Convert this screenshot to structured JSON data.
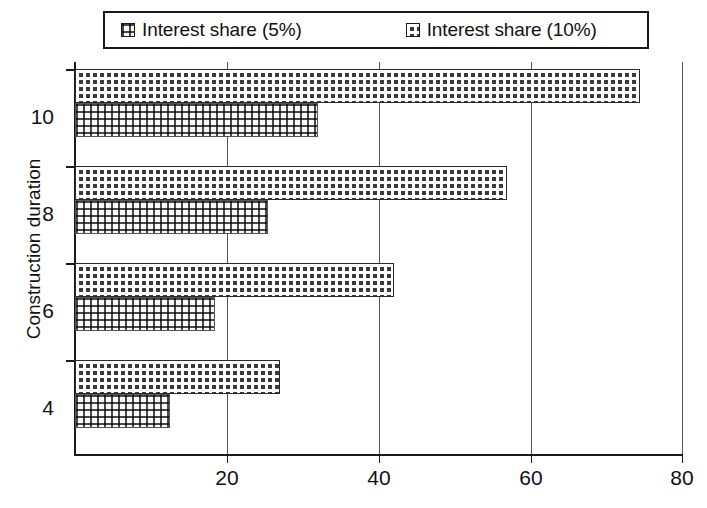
{
  "legend": {
    "entries": [
      {
        "label": "Interest share (5%)",
        "swatch": "light-dotted-swatch-icon"
      },
      {
        "label": "Interest share (10%)",
        "swatch": "dark-dotted-swatch-icon"
      }
    ]
  },
  "axes": {
    "y_title": "Construction duration",
    "y_ticks": [
      "10",
      "8",
      "6",
      "4"
    ],
    "x_ticks": [
      "20",
      "40",
      "60",
      "80"
    ]
  },
  "chart_data": {
    "type": "bar",
    "orientation": "horizontal",
    "title": "",
    "xlabel": "",
    "ylabel": "Construction duration",
    "categories": [
      "4",
      "6",
      "8",
      "10"
    ],
    "series": [
      {
        "name": "Interest share (5%)",
        "values": [
          12.5,
          18.5,
          25.5,
          32.0
        ]
      },
      {
        "name": "Interest share (10%)",
        "values": [
          27.0,
          42.0,
          57.0,
          74.5
        ]
      }
    ],
    "xlim": [
      0,
      80
    ],
    "xticks": [
      20,
      40,
      60,
      80
    ],
    "grid": "vertical",
    "legend_position": "top"
  }
}
